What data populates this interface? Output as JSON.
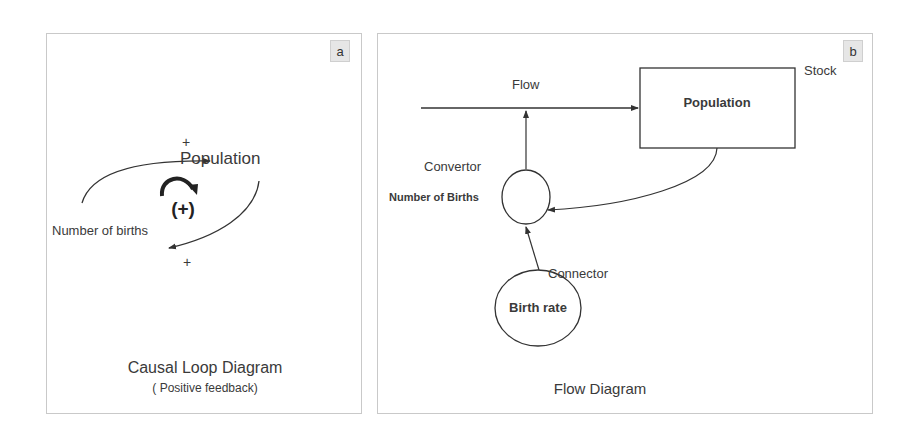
{
  "panels": {
    "a": {
      "badge": "a",
      "title": "Causal Loop Diagram",
      "subtitle": "( Positive feedback)",
      "nodes": {
        "population": "Population",
        "births": "Number of births"
      },
      "links": {
        "top_polarity": "+",
        "bottom_polarity": "+"
      },
      "loop_polarity": "(+)"
    },
    "b": {
      "badge": "b",
      "title": "Flow Diagram",
      "labels": {
        "flow": "Flow",
        "stock": "Stock",
        "convertor": "Convertor",
        "connector": "Connector"
      },
      "nodes": {
        "stock_name": "Population",
        "convertor_name": "Number of Births",
        "rate_name": "Birth rate"
      }
    }
  },
  "colors": {
    "line": "#333333",
    "border": "#c9c9c9",
    "badge_bg": "#e6e6e6"
  }
}
